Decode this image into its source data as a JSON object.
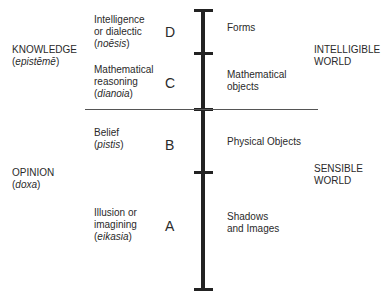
{
  "left_categories": [
    {
      "name": "KNOWLEDGE",
      "greek": "epistēmē"
    },
    {
      "name": "OPINION",
      "greek": "doxa"
    }
  ],
  "faculties": [
    {
      "line1": "Intelligence",
      "line2": "or dialectic",
      "greek": "noēsis",
      "letter": "D"
    },
    {
      "line1": "Mathematical",
      "line2": "reasoning",
      "greek": "dianoia",
      "letter": "C"
    },
    {
      "line1": "Belief",
      "greek": "pistis",
      "letter": "B"
    },
    {
      "line1": "Illusion or",
      "line2": "imagining",
      "greek": "eikasia",
      "letter": "A"
    }
  ],
  "objects": [
    {
      "line1": "Forms"
    },
    {
      "line1": "Mathematical",
      "line2": "objects"
    },
    {
      "line1": "Physical Objects"
    },
    {
      "line1": "Shadows",
      "line2": "and Images"
    }
  ],
  "right_categories": [
    {
      "line1": "INTELLIGIBLE",
      "line2": "WORLD"
    },
    {
      "line1": "SENSIBLE",
      "line2": "WORLD"
    }
  ]
}
